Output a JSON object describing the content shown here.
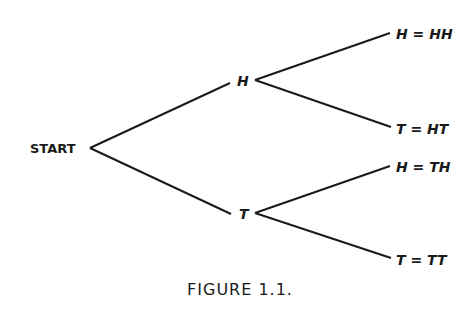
{
  "diagram": {
    "type": "tree",
    "root": {
      "label": "START"
    },
    "level1": [
      {
        "label": "H"
      },
      {
        "label": "T"
      }
    ],
    "level2": [
      {
        "parent": "H",
        "label": "H = HH"
      },
      {
        "parent": "H",
        "label": "T = HT"
      },
      {
        "parent": "T",
        "label": "H = TH"
      },
      {
        "parent": "T",
        "label": "T = TT"
      }
    ],
    "caption": "FIGURE 1.1."
  }
}
